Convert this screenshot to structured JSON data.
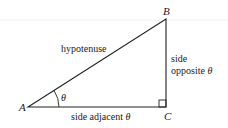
{
  "diagram": {
    "type": "right-triangle",
    "vertices": {
      "A": "A",
      "B": "B",
      "C": "C"
    },
    "angle_label": "θ",
    "sides": {
      "hypotenuse": "hypotenuse",
      "opposite_line1": "side",
      "opposite_line2": "opposite",
      "opposite_theta": "θ",
      "adjacent": "side adjacent",
      "adjacent_theta": "θ"
    },
    "colors": {
      "stroke": "#222222",
      "text": "#1a1a1a",
      "background": "#ffffff"
    }
  }
}
